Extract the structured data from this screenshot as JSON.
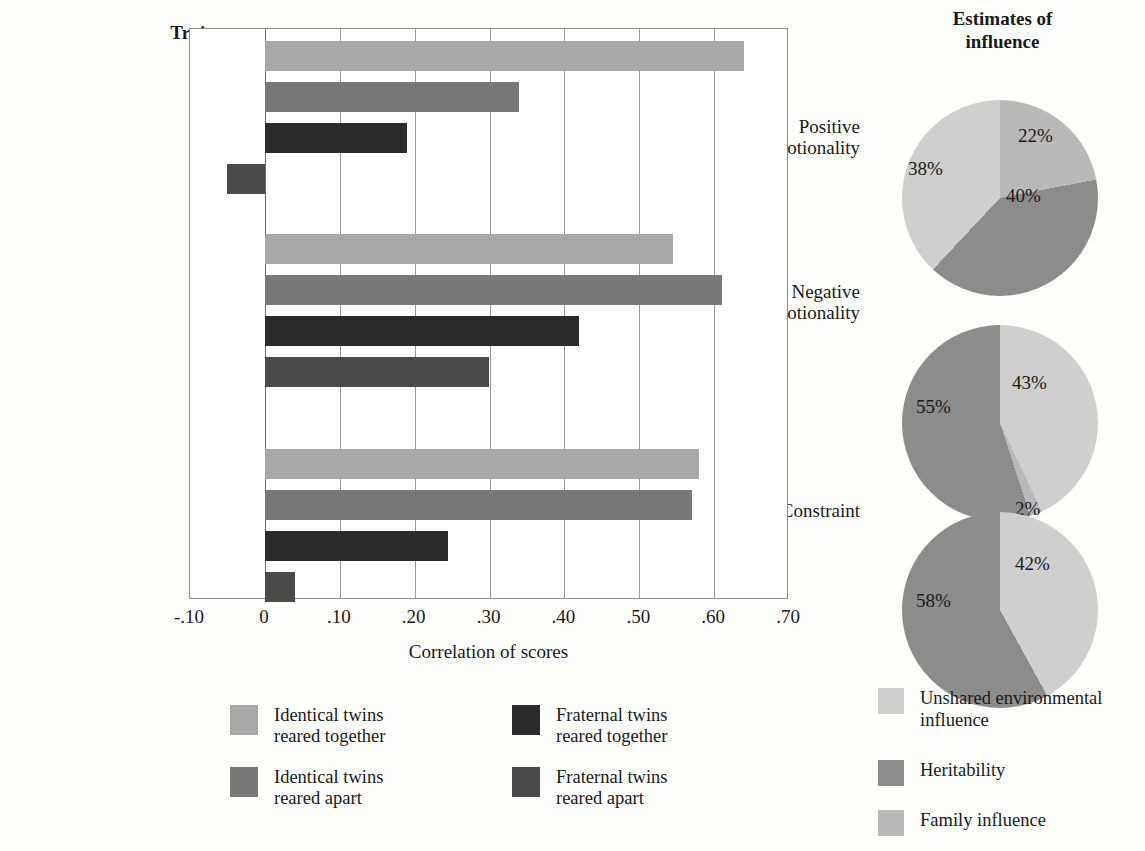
{
  "chart_data": [
    {
      "type": "bar",
      "orientation": "horizontal",
      "title": "Trait",
      "xlabel": "Correlation of scores",
      "ylabel": "Trait",
      "xlim": [
        -0.1,
        0.7
      ],
      "xticks": [
        "-.10",
        "0",
        ".10",
        ".20",
        ".30",
        ".40",
        ".50",
        ".60",
        ".70"
      ],
      "xtick_values": [
        -0.1,
        0,
        0.1,
        0.2,
        0.3,
        0.4,
        0.5,
        0.6,
        0.7
      ],
      "grid": true,
      "categories": [
        "Positive emotionality",
        "Negative emotionality",
        "Constraint"
      ],
      "series": [
        {
          "name": "Identical twins reared together",
          "color": "#a8a8a8",
          "values": [
            0.64,
            0.545,
            0.58
          ]
        },
        {
          "name": "Identical twins reared apart",
          "color": "#787878",
          "values": [
            0.34,
            0.61,
            0.57
          ]
        },
        {
          "name": "Fraternal twins reared together",
          "color": "#2b2b2b",
          "values": [
            0.19,
            0.42,
            0.245
          ]
        },
        {
          "name": "Fraternal twins reared apart",
          "color": "#4a4a4a",
          "values": [
            -0.05,
            0.3,
            0.04
          ]
        }
      ]
    },
    {
      "type": "pie",
      "title": "Estimates of influence",
      "subtitle": "Positive emotionality",
      "labels": [
        "22%",
        "40%",
        "38%"
      ],
      "slices": [
        {
          "label": "22%",
          "value": 22,
          "category": "Family influence",
          "color": "#b9b9b9"
        },
        {
          "label": "40%",
          "value": 40,
          "category": "Heritability",
          "color": "#8c8c8c"
        },
        {
          "label": "38%",
          "value": 38,
          "category": "Unshared environmental influence",
          "color": "#cfcfcf"
        }
      ]
    },
    {
      "type": "pie",
      "subtitle": "Negative emotionality",
      "labels": [
        "43%",
        "2%",
        "55%"
      ],
      "slices": [
        {
          "label": "43%",
          "value": 43,
          "category": "Unshared environmental influence",
          "color": "#cfcfcf"
        },
        {
          "label": "2%",
          "value": 2,
          "category": "Family influence",
          "color": "#b9b9b9"
        },
        {
          "label": "55%",
          "value": 55,
          "category": "Heritability",
          "color": "#8c8c8c"
        }
      ]
    },
    {
      "type": "pie",
      "subtitle": "Constraint",
      "labels": [
        "42%",
        "58%"
      ],
      "slices": [
        {
          "label": "42%",
          "value": 42,
          "category": "Unshared environmental influence",
          "color": "#cfcfcf"
        },
        {
          "label": "58%",
          "value": 58,
          "category": "Heritability",
          "color": "#8c8c8c"
        }
      ]
    }
  ],
  "bar_chart": {
    "trait_header": "Trait",
    "axis_title": "Correlation of scores",
    "ticks": [
      "-.10",
      "0",
      ".10",
      ".20",
      ".30",
      ".40",
      ".50",
      ".60",
      ".70"
    ],
    "categories": [
      {
        "line1": "Positive",
        "line2": "emotionality"
      },
      {
        "line1": "Negative",
        "line2": "emotionality"
      },
      {
        "line1": "Constraint",
        "line2": ""
      }
    ],
    "legend": [
      {
        "label": "Identical twins\nreared together",
        "color": "#a8a8a8"
      },
      {
        "label": "Fraternal twins\nreared together",
        "color": "#2b2b2b"
      },
      {
        "label": "Identical twins\nreared apart",
        "color": "#787878"
      },
      {
        "label": "Fraternal twins\nreared apart",
        "color": "#4a4a4a"
      }
    ]
  },
  "pie_panel": {
    "title": "Estimates of\ninfluence",
    "title_line1": "Estimates of",
    "title_line2": "influence",
    "legend": [
      {
        "label": "Unshared environmental\ninfluence",
        "color": "#cfcfcf"
      },
      {
        "label": "Heritability",
        "color": "#8c8c8c"
      },
      {
        "label": "Family influence",
        "color": "#b9b9b9"
      }
    ],
    "pie1": {
      "l1": "22%",
      "l2": "40%",
      "l3": "38%"
    },
    "pie2": {
      "l1": "43%",
      "l2": "55%",
      "l3": "2%"
    },
    "pie3": {
      "l1": "42%",
      "l2": "58%"
    }
  }
}
